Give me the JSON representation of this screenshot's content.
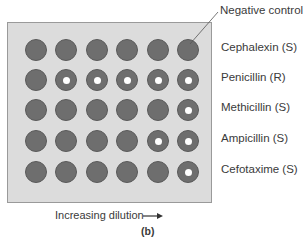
{
  "figure": {
    "caption": "(b)",
    "callout_label": "Negative control",
    "x_axis_label": "Increasing dilution",
    "arrow_icon": "right-arrow",
    "rows": [
      {
        "label": "Cephalexin (S)",
        "wells": [
          false,
          false,
          false,
          false,
          false,
          false
        ]
      },
      {
        "label": "Penicillin (R)",
        "wells": [
          false,
          true,
          true,
          true,
          true,
          true
        ]
      },
      {
        "label": "Methicillin (S)",
        "wells": [
          false,
          false,
          false,
          false,
          false,
          true
        ]
      },
      {
        "label": "Ampicillin (S)",
        "wells": [
          false,
          false,
          false,
          false,
          true,
          true
        ]
      },
      {
        "label": "Cefotaxime (S)",
        "wells": [
          false,
          false,
          false,
          false,
          false,
          true
        ]
      }
    ],
    "legend_note": "Wells with white center dot indicate bacterial growth button",
    "colors": {
      "plate": "#dcdcdc",
      "well": "#6e6e6e",
      "growth_dot": "#ffffff"
    }
  }
}
